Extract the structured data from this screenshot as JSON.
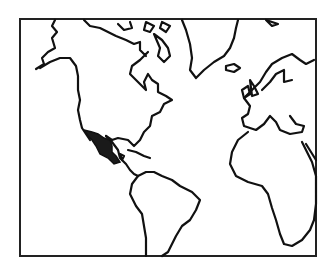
{
  "map": {
    "type": "outline world map (Americas, Atlantic, Europe, Africa)",
    "highlighted_region": "Mexico",
    "highlight_color": "#1a1a1a",
    "outline_color": "#111111",
    "background_color": "#ffffff"
  }
}
